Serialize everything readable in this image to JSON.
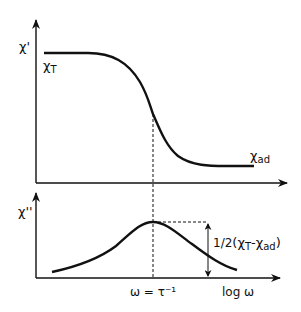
{
  "colors": {
    "ink": "#111111",
    "background": "#ffffff"
  },
  "upper_panel": {
    "y_axis_label": "χ'",
    "curve_start_label": {
      "main": "χ",
      "sub": "T"
    },
    "curve_end_label": {
      "main": "χ",
      "sub": "ad"
    },
    "description": "Real susceptibility χ' decreases sigmoidally from χT to χad versus log ω"
  },
  "lower_panel": {
    "y_axis_label": "χ''",
    "peak_annotation": {
      "prefix": "1/2",
      "open": "(",
      "a": "χ",
      "a_sub": "T",
      "minus": "-",
      "b": "χ",
      "b_sub": "ad",
      "close": ")"
    },
    "x_tick_label": "ω = τ⁻¹",
    "x_axis_label": "log ω",
    "description": "Imaginary susceptibility χ'' shows a peak at ω = τ⁻¹ with height 1/2(χT − χad)"
  }
}
